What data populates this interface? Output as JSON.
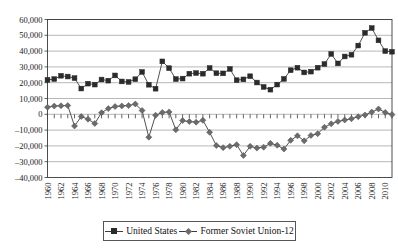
{
  "chart_data": {
    "type": "line",
    "title": "",
    "xlabel": "",
    "ylabel": "",
    "ylim": [
      -40000,
      60000
    ],
    "ytick_step": 10000,
    "grid": true,
    "legend_position": "bottom",
    "x": [
      1960,
      1961,
      1962,
      1963,
      1964,
      1965,
      1966,
      1967,
      1968,
      1969,
      1970,
      1971,
      1972,
      1973,
      1974,
      1975,
      1976,
      1977,
      1978,
      1979,
      1980,
      1981,
      1982,
      1983,
      1984,
      1985,
      1986,
      1987,
      1988,
      1989,
      1990,
      1991,
      1992,
      1993,
      1994,
      1995,
      1996,
      1997,
      1998,
      1999,
      2000,
      2001,
      2002,
      2003,
      2004,
      2005,
      2006,
      2007,
      2008,
      2009,
      2010,
      2011
    ],
    "xtick_labels": [
      "1960",
      "1962",
      "1964",
      "1966",
      "1968",
      "1970",
      "1972",
      "1974",
      "1976",
      "1978",
      "1980",
      "1982",
      "1984",
      "1986",
      "1988",
      "1990",
      "1992",
      "1994",
      "1996",
      "1998",
      "2000",
      "2002",
      "2004",
      "2006",
      "2008",
      "2010"
    ],
    "ytick_labels": [
      "60,000",
      "50,000",
      "40,000",
      "30,000",
      "20,000",
      "10,000",
      "0",
      "-10,000",
      "-20,000",
      "-30,000",
      "-40,000"
    ],
    "series": [
      {
        "name": "United States",
        "marker": "square",
        "color": "#2b2b2b",
        "values": [
          21800,
          22300,
          24400,
          23900,
          22900,
          16300,
          19400,
          18800,
          22000,
          21300,
          24600,
          20800,
          20500,
          22200,
          26800,
          18700,
          16200,
          33500,
          29200,
          22300,
          22600,
          25700,
          26100,
          25700,
          29300,
          26000,
          25900,
          28700,
          21600,
          22100,
          24100,
          20100,
          17300,
          15600,
          18800,
          22400,
          27900,
          29500,
          26500,
          27000,
          29500,
          31800,
          38200,
          32200,
          36600,
          37700,
          43500,
          51600,
          54600,
          46800,
          40000,
          39600
        ]
      },
      {
        "name": "Former Soviet Union-12",
        "marker": "diamond",
        "color": "#6b6b6b",
        "values": [
          4500,
          5200,
          5400,
          5500,
          -7400,
          -1400,
          -3100,
          -5800,
          1000,
          3600,
          4900,
          5300,
          5500,
          6500,
          2400,
          -14500,
          -600,
          1200,
          1500,
          -9800,
          -4000,
          -4600,
          -5000,
          -3800,
          -11400,
          -19800,
          -21100,
          -20300,
          -19200,
          -26000,
          -20300,
          -21400,
          -20800,
          -18400,
          -19600,
          -22000,
          -16500,
          -13600,
          -16800,
          -13400,
          -12300,
          -8200,
          -6000,
          -4500,
          -3600,
          -2800,
          -1500,
          -400,
          1400,
          3400,
          1200,
          -200
        ]
      }
    ],
    "series2_tail": {
      "note": "continues positive from 2001",
      "values_from_2001": [
        -8200,
        -6000,
        -4500,
        -3600,
        -2800,
        -1500,
        -400,
        1400,
        3400,
        1200,
        -200
      ]
    }
  },
  "legend": {
    "items": [
      {
        "label": "United States",
        "key": "square"
      },
      {
        "label": "Former Soviet Union-12",
        "key": "diamond"
      }
    ]
  }
}
